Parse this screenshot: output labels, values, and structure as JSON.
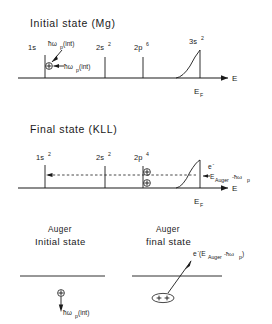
{
  "figure": {
    "width": 272,
    "height": 324,
    "background": "#ffffff",
    "ink": "#1a1a1a"
  },
  "panels": {
    "initial": {
      "title": "Initial state (Mg)",
      "levels": [
        {
          "label": "1s",
          "superscript": "",
          "x": 45
        },
        {
          "label": "2s",
          "superscript": "2",
          "x": 105
        },
        {
          "label": "2p",
          "superscript": "6",
          "x": 143
        },
        {
          "label": "3s",
          "superscript": "2",
          "x": 200
        }
      ],
      "axis_label": "E",
      "fermi_label": "E",
      "fermi_sub": "F",
      "annotation_top": "ħω",
      "annotation_top_sub": "p",
      "annotation_top_tail": "(int)",
      "annotation_bottom": "ħω",
      "annotation_bottom_sub": "p",
      "annotation_bottom_tail": "(int)",
      "hole_symbol": "+"
    },
    "final": {
      "title": "Final state (KLL)",
      "levels": [
        {
          "label": "1s",
          "superscript": "2",
          "x": 45
        },
        {
          "label": "2s",
          "superscript": "2",
          "x": 105
        },
        {
          "label": "2p",
          "superscript": "4",
          "x": 143
        },
        {
          "label": "",
          "superscript": "",
          "x": 200
        }
      ],
      "axis_label": "E",
      "fermi_label": "E",
      "fermi_sub": "F",
      "electron_symbol": "e",
      "electron_superscript": "-",
      "energy_label": "E",
      "energy_sub": "Auger",
      "energy_tail": "-ħω",
      "energy_tail_sub": "p",
      "hole_symbol": "+"
    },
    "auger_initial": {
      "title_line1": "Auger",
      "title_line2": "Initial state",
      "hole_symbol": "+",
      "annotation": "ħω",
      "annotation_sub": "p",
      "annotation_tail": "(int)"
    },
    "auger_final": {
      "title_line1": "Auger",
      "title_line2": "final state",
      "electron_symbol": "e",
      "electron_superscript": "-",
      "energy_open": "(E",
      "energy_sub": "Auger",
      "energy_tail": "-ħω",
      "energy_tail_sub": "p",
      "energy_close": ")",
      "hole_symbols": "++"
    }
  }
}
